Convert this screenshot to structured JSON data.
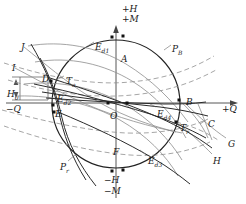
{
  "figure": {
    "title_axes": {
      "top_primary": "+H",
      "top_secondary": "+M",
      "bottom_primary": "−H",
      "bottom_secondary": "−M",
      "left": "−Q",
      "right": "+Q"
    },
    "colors": {
      "ink": "#1a1a1a",
      "circle": "#222222",
      "curve_gray": "#7d7d7d",
      "dashed": "#8c8c8c",
      "axis": "#444444",
      "background": "#ffffff"
    },
    "geometry": {
      "center_x": 116,
      "center_y": 104,
      "radius": 64
    },
    "labels": [
      {
        "id": "label-J",
        "text": "J",
        "x": 21,
        "y": 43
      },
      {
        "id": "label-I",
        "text": "I",
        "x": 12,
        "y": 64
      },
      {
        "id": "label-Ed1",
        "text": "E",
        "sub": "d1",
        "x": 95,
        "y": 43
      },
      {
        "id": "label-A",
        "text": "A",
        "x": 121,
        "y": 55
      },
      {
        "id": "label-PB",
        "text": "P",
        "sub": "B",
        "x": 172,
        "y": 45
      },
      {
        "id": "label-D",
        "text": "D",
        "x": 42,
        "y": 75
      },
      {
        "id": "label-Ta",
        "text": "T",
        "sub": "a",
        "x": 66,
        "y": 77
      },
      {
        "id": "label-Ed2",
        "text": "E",
        "sub": "d2",
        "x": 57,
        "y": 95
      },
      {
        "id": "label-E",
        "text": "E",
        "x": 55,
        "y": 110
      },
      {
        "id": "label-O",
        "text": "O",
        "x": 110,
        "y": 112
      },
      {
        "id": "label-H0",
        "text": "H",
        "sub": "0",
        "x": 7,
        "y": 90
      },
      {
        "id": "label-B",
        "text": "B",
        "x": 186,
        "y": 98
      },
      {
        "id": "label-Ed4",
        "text": "E",
        "sub": "d4",
        "x": 157,
        "y": 110
      },
      {
        "id": "label-Tr",
        "text": "T",
        "sub": "r",
        "x": 180,
        "y": 124
      },
      {
        "id": "label-C",
        "text": "C",
        "x": 208,
        "y": 120
      },
      {
        "id": "label-G",
        "text": "G",
        "x": 228,
        "y": 140
      },
      {
        "id": "label-H",
        "text": "H",
        "x": 213,
        "y": 157
      },
      {
        "id": "label-F",
        "text": "F",
        "x": 113,
        "y": 148
      },
      {
        "id": "label-Ed3",
        "text": "E",
        "sub": "d3",
        "x": 148,
        "y": 157
      },
      {
        "id": "label-Pr",
        "text": "P",
        "sub": "r",
        "x": 60,
        "y": 163
      }
    ],
    "marker_points": [
      {
        "id": "pt-top-1",
        "x": 112,
        "y": 37
      },
      {
        "id": "pt-top-2",
        "x": 123,
        "y": 36
      },
      {
        "id": "pt-D",
        "x": 51,
        "y": 81
      },
      {
        "id": "pt-E",
        "x": 53,
        "y": 105
      },
      {
        "id": "pt-E-low",
        "x": 54,
        "y": 112
      },
      {
        "id": "pt-origin-1",
        "x": 108,
        "y": 103
      },
      {
        "id": "pt-origin-2",
        "x": 127,
        "y": 103
      },
      {
        "id": "pt-B",
        "x": 179,
        "y": 100
      },
      {
        "id": "pt-Tr",
        "x": 176,
        "y": 122
      },
      {
        "id": "pt-bot-1",
        "x": 112,
        "y": 171
      },
      {
        "id": "pt-bot-2",
        "x": 123,
        "y": 170
      }
    ]
  }
}
